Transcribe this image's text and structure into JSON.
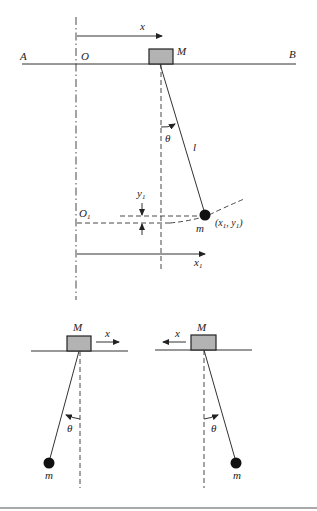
{
  "figure": {
    "top": {
      "labels": {
        "A": "A",
        "B": "B",
        "O": "O",
        "M": "M",
        "x": "x",
        "theta": "θ",
        "l": "l",
        "O1": "O",
        "O1_sub": "1",
        "y1": "y",
        "y1_sub": "1",
        "m": "m",
        "point": "(x",
        "point_sub1": "1",
        "point_mid": ", y",
        "point_sub2": "1",
        "point_end": ")",
        "x1": "x",
        "x1_sub": "1"
      }
    },
    "bottom_left": {
      "labels": {
        "M": "M",
        "x": "x",
        "theta": "θ",
        "m": "m"
      },
      "direction": "right"
    },
    "bottom_right": {
      "labels": {
        "M": "M",
        "x": "x",
        "theta": "θ",
        "m": "m"
      },
      "direction": "left"
    },
    "colors": {
      "block": "#b3b3b3",
      "line": "#333333",
      "bob": "#111111"
    }
  }
}
